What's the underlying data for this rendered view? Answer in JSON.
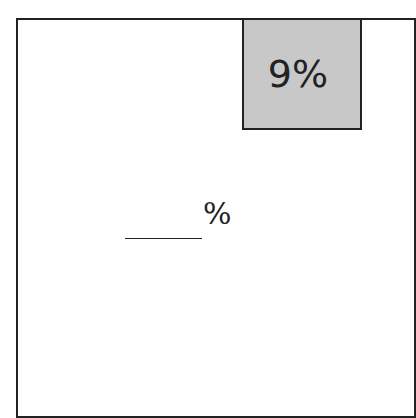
{
  "diagram": {
    "shaded_region": {
      "label": "9%",
      "fill": "#c8c8c8"
    },
    "unshaded_region": {
      "answer_blank": "",
      "suffix": "%"
    }
  }
}
